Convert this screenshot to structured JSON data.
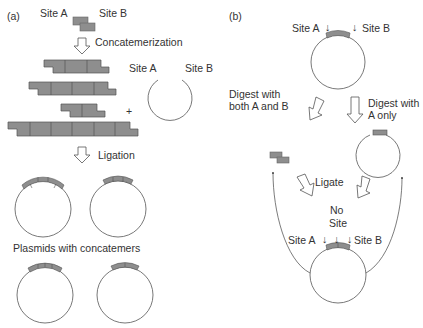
{
  "panel_a": {
    "label": "(a)",
    "site_a": "Site A",
    "site_b": "Site B",
    "step1": "Concatemerization",
    "vector_site_a": "Site A",
    "vector_site_b": "Site B",
    "plus": "+",
    "step2": "Ligation",
    "result": "Plasmids with concatemers"
  },
  "panel_b": {
    "label": "(b)",
    "top_site_a": "Site A",
    "top_site_b": "Site B",
    "digest_both_line1": "Digest with",
    "digest_both_line2": "both A and B",
    "digest_a_line1": "Digest with",
    "digest_a_line2": "A only",
    "ligate": "Ligate",
    "no_site_line1": "No",
    "no_site_line2": "Site",
    "bottom_site_a": "Site A",
    "bottom_site_b": "Site B",
    "arrow_glyph": "↓"
  },
  "colors": {
    "insert_fill": "#8e8e8e",
    "insert_stroke": "#555555",
    "line": "#555555",
    "text": "#333333"
  }
}
